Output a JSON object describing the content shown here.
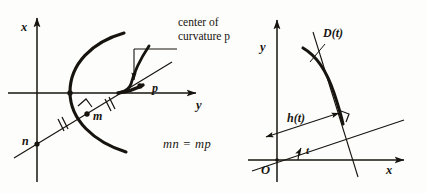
{
  "figure": {
    "background_color": "#fdfdfb",
    "ink_color": "#17140f",
    "left_panel": {
      "axes": {
        "vertical_axis_label": "x",
        "horizontal_axis_label": "y"
      },
      "points": {
        "n": "n",
        "m": "m",
        "p": "p"
      },
      "callout_line1": "center of",
      "callout_line2": "curvature p",
      "equation": "mn = mp",
      "markers": {
        "right_angle_at_m": "right-angle",
        "tick_count_per_segment": 2
      }
    },
    "right_panel": {
      "axes": {
        "vertical_axis_label": "y",
        "horizontal_axis_label": "x",
        "origin_label": "O"
      },
      "curve_label": "D(t)",
      "distance_label": "h(t)",
      "angle_label": "t",
      "markers": {
        "right_angle_at_foot": "right-angle"
      }
    }
  }
}
